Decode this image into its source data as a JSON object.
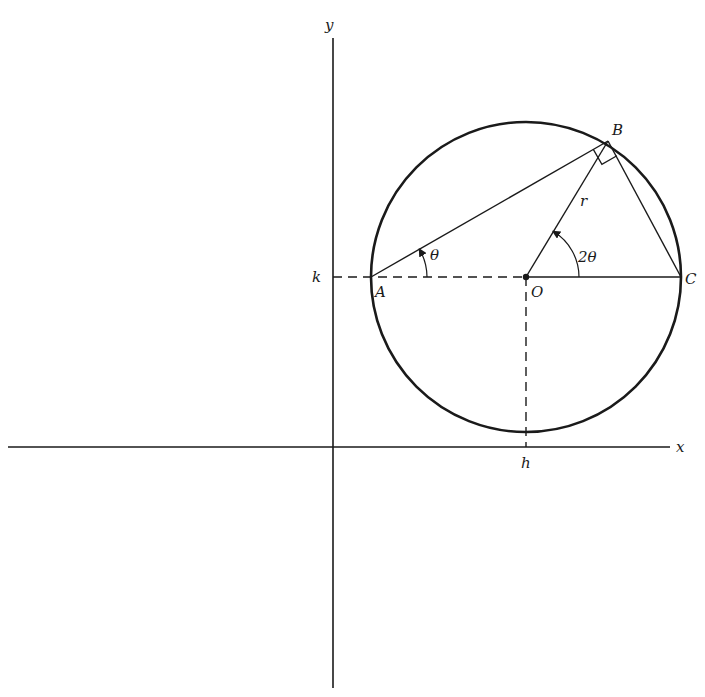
{
  "diagram": {
    "colors": {
      "ink": "#1a1a1a",
      "background": "#ffffff"
    },
    "axes": {
      "x_label": "x",
      "y_label": "y",
      "x_axis_y": 447,
      "y_axis_x": 333
    },
    "circle": {
      "cx": 526,
      "cy": 277,
      "r": 155
    },
    "points": {
      "A": {
        "label": "A",
        "x": 371,
        "y": 277
      },
      "B": {
        "label": "B",
        "x": 608,
        "y": 141
      },
      "C": {
        "label": "C",
        "x": 681,
        "y": 277
      },
      "O": {
        "label": "O",
        "x": 526,
        "y": 277
      }
    },
    "tick_labels": {
      "h": "h",
      "k": "k"
    },
    "annotations": {
      "radius": "r",
      "angle_at_A": "θ",
      "angle_at_O": "2θ",
      "right_angle_at": "B"
    }
  }
}
